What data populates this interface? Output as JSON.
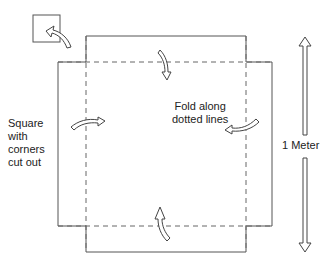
{
  "diagram": {
    "left_label_lines": [
      "Square",
      "with",
      "corners",
      "cut out"
    ],
    "center_label_lines": [
      "Fold along",
      "dotted lines"
    ],
    "dimension_label": "1 Meter",
    "colors": {
      "line": "#555555",
      "dashed": "#666666",
      "arrow_stroke": "#444444",
      "arrow_fill": "#ffffff",
      "text": "#222222"
    }
  }
}
